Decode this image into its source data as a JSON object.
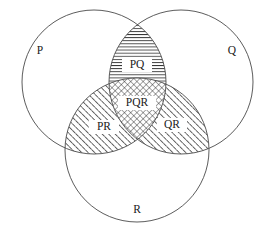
{
  "diagram": {
    "type": "venn-3-set",
    "title": "",
    "background_color": "#ffffff",
    "stroke_color": "#4a4a4a",
    "label_color": "#1a1a1a",
    "width": 272,
    "height": 237,
    "sets": [
      {
        "id": "P",
        "label": "P",
        "label_x": 40,
        "label_y": 51,
        "center_x": 94,
        "center_y": 82,
        "radius": 72
      },
      {
        "id": "Q",
        "label": "Q",
        "label_x": 232,
        "label_y": 51,
        "center_x": 181,
        "center_y": 82,
        "radius": 72
      },
      {
        "id": "R",
        "label": "R",
        "label_x": 137,
        "label_y": 210,
        "center_x": 137,
        "center_y": 150,
        "radius": 72
      }
    ],
    "regions": [
      {
        "id": "PQ",
        "label": "PQ",
        "label_x": 137,
        "label_y": 65,
        "fill_pattern": "horizontal-lines",
        "description": "intersection of P and Q only"
      },
      {
        "id": "PR",
        "label": "PR",
        "label_x": 104,
        "label_y": 127,
        "fill_pattern": "diagonal-lines-forward",
        "description": "intersection of P and R only"
      },
      {
        "id": "QR",
        "label": "QR",
        "label_x": 172,
        "label_y": 125,
        "fill_pattern": "diagonal-lines-forward",
        "description": "intersection of Q and R only"
      },
      {
        "id": "PQR",
        "label": "PQR",
        "label_x": 137,
        "label_y": 103,
        "fill_pattern": "cross-hatch",
        "description": "intersection of P, Q and R"
      }
    ]
  }
}
